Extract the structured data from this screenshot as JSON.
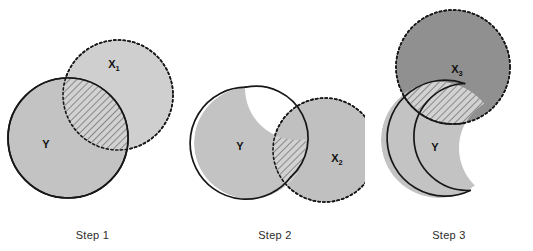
{
  "figure": {
    "background_color": "#ffffff"
  },
  "colors": {
    "fill_y_light": "#c3c3c3",
    "fill_x_light": "#cfcfcf",
    "fill_x_dark": "#909090",
    "hatch_fill": "#d2d2d2",
    "hatch_line": "#4a4a4a",
    "outline_solid": "#171717",
    "outline_dashed": "#171717",
    "caption_text": "#2b2b2b"
  },
  "panels": [
    {
      "id": "step1",
      "caption": "Step 1",
      "shapes": [
        {
          "name": "x1-circle",
          "label": "X",
          "label_sub": "1",
          "outline": "dashed",
          "fill": "light",
          "cx": 118,
          "cy": 95,
          "r": 55
        },
        {
          "name": "y-circle",
          "label": "Y",
          "label_sub": "",
          "outline": "solid",
          "fill": "light",
          "cx": 68,
          "cy": 138,
          "r": 60
        },
        {
          "name": "intersection-region",
          "label": "",
          "label_sub": "",
          "outline": "solid",
          "fill": "hatched"
        }
      ]
    },
    {
      "id": "step2",
      "caption": "Step 2",
      "shapes": [
        {
          "name": "x2-circle",
          "label": "X",
          "label_sub": "2",
          "outline": "dashed",
          "fill": "light",
          "cx": 140,
          "cy": 150,
          "r": 52
        },
        {
          "name": "y-shape",
          "label": "Y",
          "label_sub": "",
          "outline": "solid",
          "fill": "light",
          "cx": 65,
          "cy": 143,
          "r": 56
        },
        {
          "name": "intersection-region",
          "label": "",
          "label_sub": "",
          "outline": "solid",
          "fill": "hatched"
        }
      ]
    },
    {
      "id": "step3",
      "caption": "Step 3",
      "shapes": [
        {
          "name": "x3-circle",
          "label": "X",
          "label_sub": "3",
          "outline": "dashed",
          "fill": "dark",
          "cx": 88,
          "cy": 67,
          "r": 57
        },
        {
          "name": "y-shape",
          "label": "Y",
          "label_sub": "",
          "outline": "solid",
          "fill": "light",
          "cx": 74,
          "cy": 140,
          "r": 58
        },
        {
          "name": "intersection-region",
          "label": "",
          "label_sub": "",
          "outline": "solid",
          "fill": "hatched"
        }
      ]
    }
  ],
  "labels": {
    "x1": "X",
    "x1_sub": "1",
    "x2": "X",
    "x2_sub": "2",
    "x3": "X",
    "x3_sub": "3",
    "y": "Y"
  },
  "captions": {
    "step1": "Step 1",
    "step2": "Step 2",
    "step3": "Step 3"
  }
}
